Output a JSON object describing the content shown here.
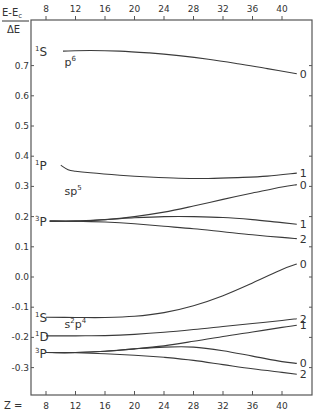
{
  "chart_data": {
    "type": "line",
    "title": "",
    "ylabel": "E-E_c / ΔE",
    "ylabel_numerator": "E-E",
    "ylabel_numerator_sub": "c",
    "ylabel_denominator": "ΔE",
    "xlabel": "Z =",
    "xlim": [
      8,
      42
    ],
    "ylim": [
      -0.4,
      0.8
    ],
    "grid": false,
    "x_ticks": [
      8,
      12,
      16,
      20,
      24,
      28,
      32,
      36,
      40
    ],
    "x_tick_labels": [
      "8",
      "12",
      "16",
      "20",
      "24",
      "28",
      "32",
      "36",
      "40"
    ],
    "y_ticks": [
      0.7,
      0.6,
      0.5,
      0.4,
      0.3,
      0.2,
      0.1,
      0.0,
      -0.1,
      -0.2,
      -0.3
    ],
    "y_tick_labels": [
      "0.7",
      "0.6",
      "0.5",
      "0.4",
      "0.3",
      "0.2",
      "0.1",
      "0.0",
      "-0.1",
      "-0.2",
      "-0.3"
    ],
    "configurations": [
      {
        "base": "p",
        "sup": "6",
        "x": 10.5,
        "y": 0.7
      },
      {
        "base": "sp",
        "sup": "5",
        "x": 10.5,
        "y": 0.27
      },
      {
        "base": "s",
        "sup": "2",
        "base2": "p",
        "sup2": "4",
        "x": 10.5,
        "y": -0.17
      }
    ],
    "terms": [
      {
        "mult": "1",
        "L": "S",
        "y": 0.748
      },
      {
        "mult": "1",
        "L": "P",
        "y": 0.37
      },
      {
        "mult": "3",
        "L": "P",
        "y": 0.185
      },
      {
        "mult": "1",
        "L": "S",
        "y": -0.133
      },
      {
        "mult": "1",
        "L": "D",
        "y": -0.195
      },
      {
        "mult": "3",
        "L": "P",
        "y": -0.25
      }
    ],
    "series": [
      {
        "name": "p6 1S J=0",
        "J": "0",
        "x": [
          10.3,
          14,
          18,
          22,
          26,
          30,
          34,
          38,
          42
        ],
        "values": [
          0.748,
          0.75,
          0.748,
          0.742,
          0.733,
          0.721,
          0.706,
          0.69,
          0.673
        ]
      },
      {
        "name": "sp5 1P J=1",
        "J": "1",
        "x": [
          10,
          11,
          12,
          14,
          18,
          22,
          26,
          30,
          34,
          38,
          42
        ],
        "values": [
          0.37,
          0.355,
          0.35,
          0.345,
          0.337,
          0.331,
          0.327,
          0.326,
          0.329,
          0.334,
          0.344
        ]
      },
      {
        "name": "sp5 3P J=0",
        "J": "0",
        "x": [
          8.5,
          12,
          16,
          20,
          24,
          28,
          32,
          36,
          40,
          42
        ],
        "values": [
          0.185,
          0.185,
          0.19,
          0.2,
          0.215,
          0.235,
          0.257,
          0.278,
          0.298,
          0.306
        ]
      },
      {
        "name": "sp5 3P J=1",
        "J": "1",
        "x": [
          8.5,
          12,
          16,
          20,
          24,
          28,
          32,
          36,
          40,
          42
        ],
        "values": [
          0.185,
          0.185,
          0.19,
          0.196,
          0.2,
          0.2,
          0.197,
          0.19,
          0.18,
          0.175
        ]
      },
      {
        "name": "sp5 3P J=2",
        "J": "2",
        "x": [
          8.5,
          12,
          16,
          20,
          24,
          28,
          32,
          36,
          40,
          42
        ],
        "values": [
          0.185,
          0.185,
          0.182,
          0.176,
          0.168,
          0.16,
          0.15,
          0.14,
          0.131,
          0.127
        ]
      },
      {
        "name": "s2p4 1S J=0",
        "J": "0",
        "x": [
          8,
          12,
          16,
          20,
          24,
          28,
          32,
          36,
          40,
          42
        ],
        "values": [
          -0.133,
          -0.134,
          -0.134,
          -0.13,
          -0.118,
          -0.095,
          -0.062,
          -0.02,
          0.025,
          0.043
        ]
      },
      {
        "name": "s2p4 1D J=2",
        "J": "2",
        "x": [
          8,
          12,
          16,
          20,
          24,
          28,
          32,
          36,
          40,
          42
        ],
        "values": [
          -0.195,
          -0.195,
          -0.194,
          -0.19,
          -0.183,
          -0.174,
          -0.164,
          -0.154,
          -0.144,
          -0.138
        ]
      },
      {
        "name": "s2p4 3P J=1",
        "J": "1",
        "x": [
          8,
          12,
          16,
          20,
          24,
          28,
          32,
          36,
          40,
          42
        ],
        "values": [
          -0.25,
          -0.25,
          -0.246,
          -0.238,
          -0.228,
          -0.213,
          -0.197,
          -0.182,
          -0.167,
          -0.16
        ]
      },
      {
        "name": "s2p4 3P J=0",
        "J": "0",
        "x": [
          8,
          12,
          16,
          20,
          24,
          28,
          32,
          36,
          40,
          42
        ],
        "values": [
          -0.25,
          -0.25,
          -0.246,
          -0.238,
          -0.232,
          -0.232,
          -0.244,
          -0.262,
          -0.28,
          -0.286
        ]
      },
      {
        "name": "s2p4 3P J=2",
        "J": "2",
        "x": [
          8,
          12,
          16,
          20,
          24,
          28,
          32,
          36,
          40,
          42
        ],
        "values": [
          -0.25,
          -0.251,
          -0.254,
          -0.259,
          -0.266,
          -0.276,
          -0.29,
          -0.304,
          -0.316,
          -0.322
        ]
      }
    ]
  }
}
